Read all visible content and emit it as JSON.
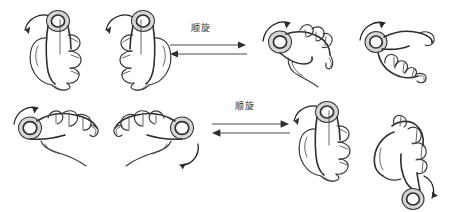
{
  "figure": {
    "background_color": "#ffffff",
    "ink_color": "#3a3a3a",
    "accent_color": "#2d2d2d"
  },
  "transitions": [
    {
      "id": "top-transition",
      "label": "顺旋",
      "direction": "bidirectional",
      "top_arrow": "right",
      "bottom_arrow": "left"
    },
    {
      "id": "bottom-transition",
      "label": "顺旋",
      "direction": "bidirectional",
      "top_arrow": "right",
      "bottom_arrow": "left"
    }
  ],
  "panels": [
    {
      "id": "panel-top-left",
      "hands": [
        {
          "id": "hand-tl-a",
          "pose": "vertical-grip",
          "rotation_arrow": "counter-clockwise",
          "object": "ring"
        },
        {
          "id": "hand-tl-b",
          "pose": "vertical-grip-mirrored",
          "rotation_arrow": "counter-clockwise",
          "object": "ring"
        }
      ]
    },
    {
      "id": "panel-top-right",
      "hands": [
        {
          "id": "hand-tr-a",
          "pose": "tilted-grip",
          "rotation_arrow": "clockwise",
          "object": "ring"
        },
        {
          "id": "hand-tr-b",
          "pose": "tilted-grip-low",
          "rotation_arrow": "clockwise",
          "object": "ring"
        }
      ]
    },
    {
      "id": "panel-bottom-left",
      "hands": [
        {
          "id": "hand-bl-a",
          "pose": "horizontal-grip",
          "rotation_arrow": "clockwise",
          "object": "ring"
        },
        {
          "id": "hand-bl-b",
          "pose": "horizontal-grip-mirrored",
          "rotation_arrow": "clockwise",
          "object": "ring"
        }
      ]
    },
    {
      "id": "panel-bottom-right",
      "hands": [
        {
          "id": "hand-br-a",
          "pose": "vertical-grip",
          "rotation_arrow": "counter-clockwise",
          "object": "ring"
        },
        {
          "id": "hand-br-b",
          "pose": "tilted-down-grip",
          "rotation_arrow": "clockwise",
          "object": "ring"
        }
      ]
    }
  ]
}
